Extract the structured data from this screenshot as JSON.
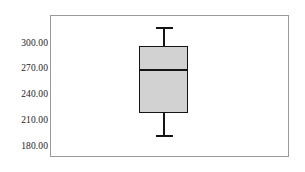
{
  "chart_data": {
    "type": "box",
    "title": "",
    "xlabel": "",
    "ylabel": "",
    "categories": [
      "1"
    ],
    "ylim": [
      168,
      325
    ],
    "grid": false,
    "legend": null,
    "y_ticks": [
      {
        "value": 300.0,
        "label": "300.00"
      },
      {
        "value": 270.0,
        "label": "270.00"
      },
      {
        "value": 240.0,
        "label": "240.00"
      },
      {
        "value": 210.0,
        "label": "210.00"
      },
      {
        "value": 180.0,
        "label": "180.00"
      }
    ],
    "boxes": [
      {
        "name": "1",
        "whisker_high": 317.0,
        "q3": 296.0,
        "median": 268.0,
        "q1": 218.0,
        "whisker_low": 191.0,
        "outliers": [],
        "fill_color": "#d2d2d2",
        "line_color": "#141414"
      }
    ]
  },
  "figure": {
    "background_color": "#ffffff",
    "frame_color": "#9a9a9a",
    "tick_color": "#6d6d6d",
    "label_color": "#1a1a1a"
  }
}
